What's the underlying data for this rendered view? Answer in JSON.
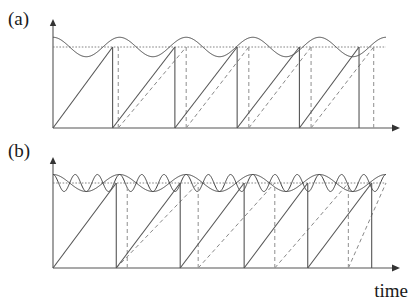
{
  "figure": {
    "panel_a_label": "(a)",
    "panel_b_label": "(b)",
    "xaxis_label": "time"
  },
  "chart_data": {
    "type": "line",
    "title": "",
    "xlabel": "time",
    "ylabel": "",
    "grid": false,
    "legend": "none",
    "panels": [
      {
        "id": "a",
        "label": "(a)",
        "xlim": [
          0,
          1
        ],
        "ylim": [
          0,
          1
        ],
        "axis_px": {
          "x0": 53,
          "x1": 400,
          "ybase": 128,
          "ytop": 20
        },
        "threshold": {
          "value": 0.75,
          "style": "dotted",
          "y_px": 47
        },
        "input_sines": [
          {
            "name": "slow-drive",
            "cycles": 5,
            "amplitude": 0.09,
            "offset": 0.75,
            "phase_deg": 180,
            "style": "solid"
          }
        ],
        "solid_ramps": [
          {
            "t_start": 0.0,
            "t_fire": 0.179
          },
          {
            "t_start": 0.179,
            "t_fire": 0.366
          },
          {
            "t_start": 0.366,
            "t_fire": 0.553
          },
          {
            "t_start": 0.553,
            "t_fire": 0.74
          },
          {
            "t_start": 0.74,
            "t_fire": 0.919
          }
        ],
        "dashed_ramps": [
          {
            "t_start": 0.196,
            "t_fire": 0.4
          },
          {
            "t_start": 0.4,
            "t_fire": 0.588
          },
          {
            "t_start": 0.588,
            "t_fire": 0.775
          },
          {
            "t_start": 0.775,
            "t_fire": 0.963
          }
        ],
        "reset_lines_solid": [
          0.179,
          0.366,
          0.553,
          0.74,
          0.919
        ],
        "reset_lines_dashed": [
          0.196,
          0.4,
          0.588,
          0.775,
          0.963
        ]
      },
      {
        "id": "b",
        "label": "(b)",
        "xlim": [
          0,
          1
        ],
        "ylim": [
          0,
          1
        ],
        "axis_px": {
          "x0": 53,
          "x1": 400,
          "ybase": 268,
          "ytop": 158
        },
        "threshold": {
          "value": 0.75,
          "style": "dotted",
          "y_px": 183
        },
        "input_sines": [
          {
            "name": "fast-drive",
            "cycles": 15,
            "amplitude": 0.075,
            "offset": 0.75,
            "phase_deg": 180,
            "style": "solid"
          },
          {
            "name": "slow-drive",
            "cycles": 5,
            "amplitude": 0.075,
            "offset": 0.75,
            "phase_deg": 180,
            "style": "solid"
          }
        ],
        "solid_ramps": [
          {
            "t_start": 0.0,
            "t_fire": 0.19
          },
          {
            "t_start": 0.19,
            "t_fire": 0.382
          },
          {
            "t_start": 0.382,
            "t_fire": 0.574
          },
          {
            "t_start": 0.574,
            "t_fire": 0.765
          },
          {
            "t_start": 0.765,
            "t_fire": 0.957
          }
        ],
        "dashed_ramps": [
          {
            "t_start": 0.19,
            "t_fire": 0.436
          },
          {
            "t_start": 0.436,
            "t_fire": 0.666
          },
          {
            "t_start": 0.666,
            "t_fire": 0.887
          },
          {
            "t_start": 0.887,
            "t_fire": 1.0
          }
        ],
        "reset_lines_solid": [
          0.19,
          0.382,
          0.574,
          0.765,
          0.957
        ],
        "reset_lines_dashed": [
          0.223,
          0.436,
          0.666,
          0.887
        ]
      }
    ]
  },
  "colors": {
    "axis": "#555555",
    "solid_trace": "#555555",
    "dashed_trace": "#999999",
    "threshold": "#777777",
    "text": "#1a1a1a",
    "background": "#ffffff"
  }
}
